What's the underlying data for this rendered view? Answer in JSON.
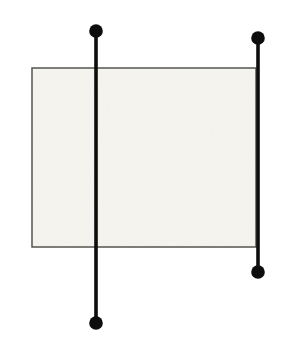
{
  "figure": {
    "width": 285,
    "height": 350,
    "background_color": "#ffffff"
  },
  "shapes": {
    "panel": {
      "name": "rectangle",
      "x": 32,
      "y": 68,
      "width": 224,
      "height": 179,
      "fill_color": "#f6f5ef",
      "stroke_color": "#55554f",
      "stroke_width": 1.5
    },
    "lines": [
      {
        "name": "left-vertical-line",
        "x": 96,
        "y1": 31,
        "y2": 323,
        "stroke_color": "#0d0d0d",
        "stroke_width": 3.6,
        "endpoints": [
          {
            "name": "top-endpoint-dot",
            "cx": 96,
            "cy": 31,
            "r": 6.8
          },
          {
            "name": "bottom-endpoint-dot",
            "cx": 96,
            "cy": 323,
            "r": 6.8
          }
        ]
      },
      {
        "name": "right-vertical-line",
        "x": 258,
        "y1": 38,
        "y2": 272,
        "stroke_color": "#0d0d0d",
        "stroke_width": 3.6,
        "endpoints": [
          {
            "name": "top-endpoint-dot",
            "cx": 258,
            "cy": 38,
            "r": 6.8
          },
          {
            "name": "bottom-endpoint-dot",
            "cx": 258,
            "cy": 272,
            "r": 6.8
          }
        ]
      }
    ]
  },
  "colors": {
    "ink": "#0d0d0d",
    "panel_fill": "#f6f5ef",
    "panel_stroke": "#55554f",
    "background": "#ffffff"
  }
}
